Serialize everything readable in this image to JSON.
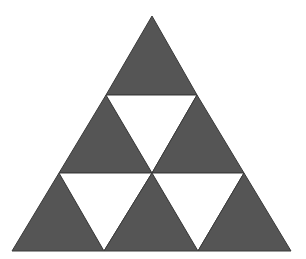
{
  "figure": {
    "colors": {
      "background": "#ffffff",
      "filled": "#555555",
      "empty": "#ffffff",
      "stroke": "#3a3a3a"
    },
    "rows": 3,
    "filled_count": 6,
    "empty_count": 3,
    "triangles": [
      {
        "id": "row1-up",
        "row": 1,
        "orientation": "up",
        "filled": true,
        "points": "152,16 106,95 197,95"
      },
      {
        "id": "row2-up-left",
        "row": 2,
        "orientation": "up",
        "filled": true,
        "points": "106,95 59,173 152,173"
      },
      {
        "id": "row2-down-center",
        "row": 2,
        "orientation": "down",
        "filled": false,
        "points": "106,95 197,95 152,173"
      },
      {
        "id": "row2-up-right",
        "row": 2,
        "orientation": "up",
        "filled": true,
        "points": "197,95 152,173 244,173"
      },
      {
        "id": "row3-up-left",
        "row": 3,
        "orientation": "up",
        "filled": true,
        "points": "59,173 12,251 104,251"
      },
      {
        "id": "row3-down-left",
        "row": 3,
        "orientation": "down",
        "filled": false,
        "points": "59,173 152,173 104,251"
      },
      {
        "id": "row3-up-center",
        "row": 3,
        "orientation": "up",
        "filled": true,
        "points": "152,173 104,251 198,251"
      },
      {
        "id": "row3-down-right",
        "row": 3,
        "orientation": "down",
        "filled": false,
        "points": "152,173 244,173 198,251"
      },
      {
        "id": "row3-up-right",
        "row": 3,
        "orientation": "up",
        "filled": true,
        "points": "244,173 198,251 291,251"
      }
    ]
  }
}
